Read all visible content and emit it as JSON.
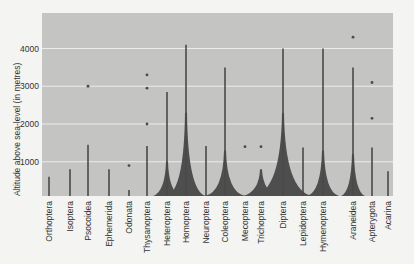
{
  "chart_data": {
    "type": "bar",
    "title": "",
    "xlabel": "",
    "ylabel": "Altitude above sea-level (in metres)",
    "ylim": [
      0,
      4800
    ],
    "yticks": [
      1000,
      2000,
      3000,
      4000
    ],
    "grid": true,
    "categories": [
      "Orthoptera",
      "Isoptera",
      "Psocoidea",
      "Ephemerida",
      "Odonata",
      "Thysanoptera",
      "Heteroptera",
      "Homoptera",
      "Neuroptera",
      "Coleoptera",
      "Mecoptera",
      "Trichoptera",
      "Diptera",
      "Lepidoptera",
      "Hymenoptera",
      "Araneidea",
      "Apterygota",
      "Acarina"
    ],
    "series": [
      {
        "name": "max_altitude_line",
        "values": [
          600,
          800,
          1450,
          800,
          250,
          1420,
          2850,
          4100,
          1420,
          3500,
          null,
          null,
          4000,
          1380,
          4000,
          3500,
          1380,
          750
        ]
      },
      {
        "name": "isolated_records",
        "values": [
          [],
          [],
          [
            3000
          ],
          [],
          [
            900
          ],
          [
            3300,
            2950,
            2000
          ],
          [],
          [],
          [],
          [],
          [
            1400
          ],
          [
            1400
          ],
          [],
          [],
          [],
          [
            4300
          ],
          [
            3100,
            2150
          ],
          []
        ]
      },
      {
        "name": "abundance_spread_width_px",
        "values": [
          0,
          0,
          0,
          0,
          0,
          0,
          14,
          20,
          0,
          20,
          0,
          18,
          30,
          0,
          16,
          12,
          0,
          0
        ]
      }
    ]
  },
  "axis": {
    "ylabel": "Altitude above sea-level (in metres)",
    "ticks": [
      "1000",
      "2000",
      "3000",
      "4000"
    ]
  },
  "labels": [
    "Orthoptera",
    "Isoptera",
    "Psocoidea",
    "Ephemerida",
    "Odonata",
    "Thysanoptera",
    "Heteroptera",
    "Homoptera",
    "Neuroptera",
    "Coleoptera",
    "Mecoptera",
    "Trichoptera",
    "Diptera",
    "Lepidoptera",
    "Hymenoptera",
    "Araneidea",
    "Apterygota",
    "Acarina"
  ],
  "colors": {
    "plot_bg": "#c4c4c2",
    "grid": "#ececea",
    "ink": "#4a4a4a"
  }
}
